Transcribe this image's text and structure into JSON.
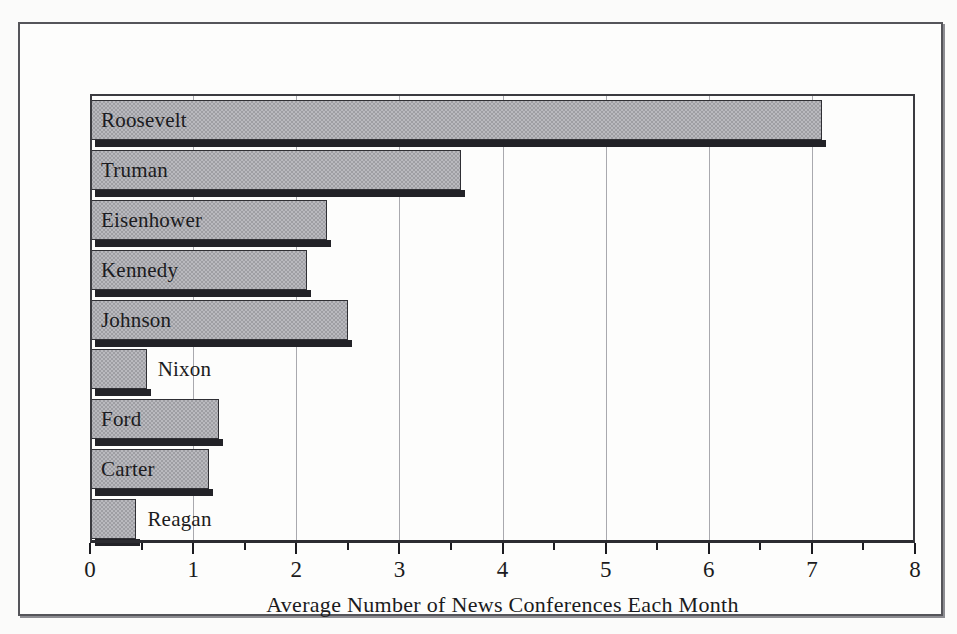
{
  "figure": {
    "background_color": "#fbfbfa",
    "frame_color": "#55555a",
    "plot_border_color": "#3b3b40",
    "gridline_color": "#a9a9ae",
    "bar_fill_color": "#9e9ea3",
    "bar_edge_color": "#2f2f34",
    "bar_shadow_color": "#222227",
    "text_color": "#1b1b20"
  },
  "chart_data": {
    "type": "bar",
    "orientation": "horizontal",
    "title": "",
    "subtitle": "",
    "xlabel": "Average Number of News Conferences Each Month",
    "ylabel": "",
    "xlim": [
      0,
      8
    ],
    "grid": true,
    "grid_axis": "x",
    "legend": false,
    "legend_position": "none",
    "xticks": [
      0,
      1,
      2,
      3,
      4,
      5,
      6,
      7,
      8
    ],
    "xtick_labels": [
      "0",
      "1",
      "2",
      "3",
      "4",
      "5",
      "6",
      "7",
      "8"
    ],
    "xminor_ticks": [
      0.5,
      1.5,
      2.5,
      3.5,
      4.5,
      5.5,
      6.5,
      7.5
    ],
    "categories": [
      "Roosevelt",
      "Truman",
      "Eisenhower",
      "Kennedy",
      "Johnson",
      "Nixon",
      "Ford",
      "Carter",
      "Reagan"
    ],
    "values": [
      7.1,
      3.6,
      2.3,
      2.1,
      2.5,
      0.55,
      1.25,
      1.15,
      0.45
    ],
    "label_placement": [
      "inside",
      "inside",
      "inside",
      "inside",
      "inside",
      "outside",
      "inside",
      "inside",
      "outside"
    ]
  }
}
